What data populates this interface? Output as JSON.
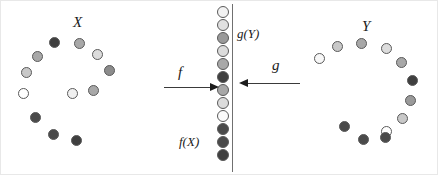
{
  "figure": {
    "title_visible": false,
    "background_color": "#ffffff",
    "width": 438,
    "height": 175
  },
  "labels": {
    "domain_set": "X",
    "codomain_set": "Y",
    "forward_map": "f",
    "backward_map": "g",
    "forward_image": "f(X)",
    "backward_image": "g(Y)"
  },
  "palette": {
    "white": "#ffffff",
    "very_light": "#f0f0f0",
    "light": "#dcdcdc",
    "mid_light": "#c8c8c8",
    "mid": "#a8a8a8",
    "mid_dark": "#8c8c8c",
    "dark": "#606060",
    "very_dark": "#3f3f3f",
    "black": "#2b2b2b",
    "outline": "#5a5a5a",
    "arrow": "#1c1c1c",
    "line": "#707070"
  },
  "clusters": {
    "left": {
      "name": "X",
      "label_x": 72,
      "label_y": 14,
      "dots": [
        {
          "x": 48,
          "y": 36,
          "d": 11,
          "fill": "#3f3f3f"
        },
        {
          "x": 73,
          "y": 37,
          "d": 11,
          "fill": "#a8a8a8"
        },
        {
          "x": 31,
          "y": 50,
          "d": 11,
          "fill": "#a8a8a8"
        },
        {
          "x": 91,
          "y": 48,
          "d": 11,
          "fill": "#dcdcdc"
        },
        {
          "x": 20,
          "y": 66,
          "d": 11,
          "fill": "#c8c8c8"
        },
        {
          "x": 103,
          "y": 64,
          "d": 11,
          "fill": "#8c8c8c"
        },
        {
          "x": 17,
          "y": 87,
          "d": 11,
          "fill": "#ffffff"
        },
        {
          "x": 87,
          "y": 84,
          "d": 11,
          "fill": "#a8a8a8"
        },
        {
          "x": 66,
          "y": 87,
          "d": 11,
          "fill": "#f0f0f0"
        },
        {
          "x": 29,
          "y": 111,
          "d": 11,
          "fill": "#4a4a4a"
        },
        {
          "x": 47,
          "y": 128,
          "d": 11,
          "fill": "#4a4a4a"
        },
        {
          "x": 70,
          "y": 134,
          "d": 11,
          "fill": "#3f3f3f"
        }
      ]
    },
    "right": {
      "name": "Y",
      "label_x": 361,
      "label_y": 18,
      "dots": [
        {
          "x": 355,
          "y": 37,
          "d": 11,
          "fill": "#a8a8a8"
        },
        {
          "x": 331,
          "y": 40,
          "d": 11,
          "fill": "#c8c8c8"
        },
        {
          "x": 380,
          "y": 42,
          "d": 11,
          "fill": "#dcdcdc"
        },
        {
          "x": 313,
          "y": 52,
          "d": 11,
          "fill": "#f7f7f7"
        },
        {
          "x": 395,
          "y": 56,
          "d": 11,
          "fill": "#a8a8a8"
        },
        {
          "x": 406,
          "y": 74,
          "d": 11,
          "fill": "#3f3f3f"
        },
        {
          "x": 404,
          "y": 94,
          "d": 11,
          "fill": "#9a9a9a"
        },
        {
          "x": 396,
          "y": 112,
          "d": 11,
          "fill": "#c8c8c8"
        },
        {
          "x": 380,
          "y": 125,
          "d": 11,
          "fill": "#ffffff"
        },
        {
          "x": 338,
          "y": 120,
          "d": 11,
          "fill": "#4a4a4a"
        },
        {
          "x": 357,
          "y": 133,
          "d": 11,
          "fill": "#4a4a4a"
        },
        {
          "x": 379,
          "y": 131,
          "d": 11,
          "fill": "#4a4a4a"
        }
      ]
    },
    "middle": {
      "name": "middle-column",
      "x": 216,
      "start_y": 5,
      "spacing": 13,
      "dot_size": 12,
      "dots": [
        {
          "fill": "#f2f2f2"
        },
        {
          "fill": "#e0e0e0"
        },
        {
          "fill": "#9a9a9a"
        },
        {
          "fill": "#dcdcdc"
        },
        {
          "fill": "#a8a8a8"
        },
        {
          "fill": "#3f3f3f"
        },
        {
          "fill": "#a8a8a8"
        },
        {
          "fill": "#dcdcdc"
        },
        {
          "fill": "#fbfbfb"
        },
        {
          "fill": "#4a4a4a"
        },
        {
          "fill": "#4a4a4a"
        },
        {
          "fill": "#3f3f3f"
        }
      ]
    }
  },
  "arrows": {
    "forward": {
      "x": 163,
      "y": 86,
      "length": 46,
      "direction": "right",
      "label_x": 177,
      "label_y": 64
    },
    "backward": {
      "x": 247,
      "y": 82,
      "length": 52,
      "direction": "left",
      "label_x": 271,
      "label_y": 57
    }
  },
  "divider": {
    "x": 231,
    "y": 3,
    "height": 168
  }
}
